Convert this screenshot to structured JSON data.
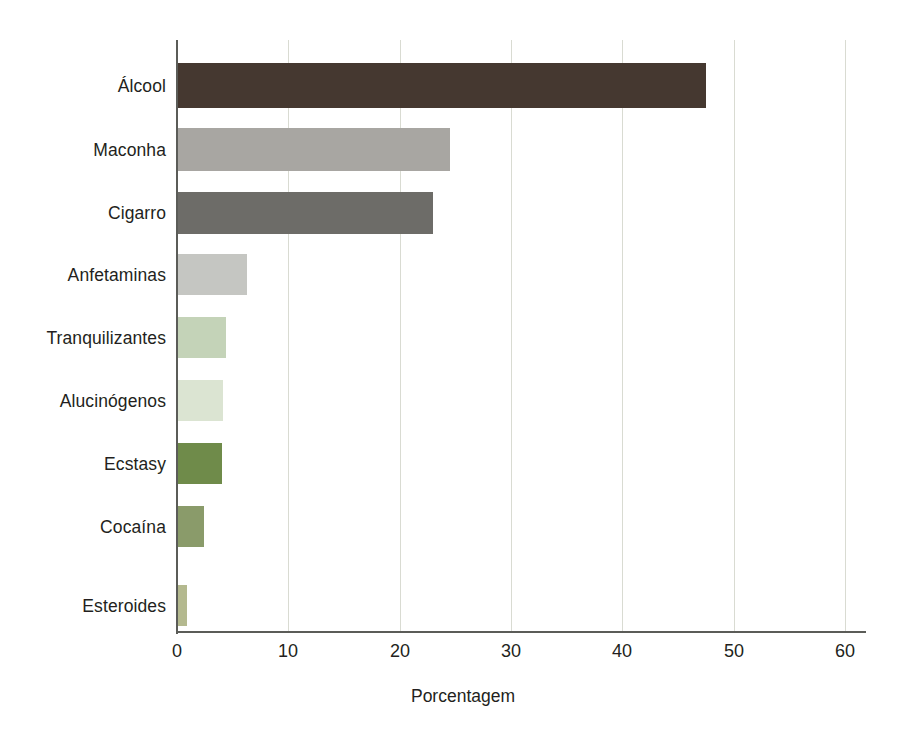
{
  "chart_data": {
    "type": "bar",
    "orientation": "horizontal",
    "title": "",
    "xlabel": "Porcentagem",
    "ylabel": "",
    "xlim": [
      0,
      60
    ],
    "ylim": null,
    "grid": true,
    "legend": "none",
    "xticks": [
      0,
      10,
      20,
      30,
      40,
      50,
      60
    ],
    "xtick_labels": [
      "0",
      "10",
      "20",
      "30",
      "40",
      "50",
      "60"
    ],
    "categories": [
      "Álcool",
      "Maconha",
      "Cigarro",
      "Anfetaminas",
      "Tranquilizantes",
      "Alucinógenos",
      "Ecstasy",
      "Cocaína",
      "Esteroides"
    ],
    "values": [
      47.5,
      24.5,
      23.0,
      6.3,
      4.4,
      4.1,
      4.0,
      2.4,
      0.9
    ],
    "bar_colors": [
      "#453830",
      "#a8a6a2",
      "#6d6c68",
      "#c5c6c2",
      "#c4d3b8",
      "#dbe4d2",
      "#6f8b4a",
      "#8a9b6a",
      "#b4b98f"
    ]
  },
  "axis": {
    "x_title": "Porcentagem",
    "tick_0": "0",
    "tick_10": "10",
    "tick_20": "20",
    "tick_30": "30",
    "tick_40": "40",
    "tick_50": "50",
    "tick_60": "60"
  },
  "labels": {
    "cat0": "Álcool",
    "cat1": "Maconha",
    "cat2": "Cigarro",
    "cat3": "Anfetaminas",
    "cat4": "Tranquilizantes",
    "cat5": "Alucinógenos",
    "cat6": "Ecstasy",
    "cat7": "Cocaína",
    "cat8": "Esteroides"
  },
  "colors": {
    "axis_line": "#5b5c58",
    "gridline": "#d9dbd2",
    "text": "#231f20",
    "background": "#ffffff"
  }
}
